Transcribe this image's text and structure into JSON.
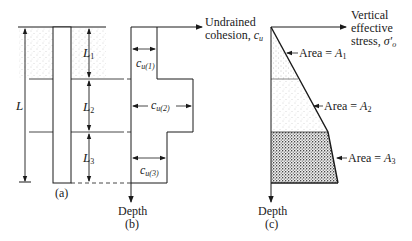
{
  "figure_a": {
    "caption": "(a)",
    "total_length_label": "L",
    "layer_labels": [
      "L",
      "L",
      "L"
    ],
    "layer_subscripts": [
      "1",
      "2",
      "3"
    ]
  },
  "figure_b": {
    "caption": "(b)",
    "x_axis_label_line1": "Undrained",
    "x_axis_label_line2": "cohesion, ",
    "x_axis_symbol": "c",
    "x_axis_symbol_sub": "u",
    "y_axis_label": "Depth",
    "cohesion_labels": [
      {
        "symbol": "c",
        "sub": "u(1)"
      },
      {
        "symbol": "c",
        "sub": "u(2)"
      },
      {
        "symbol": "c",
        "sub": "u(3)"
      }
    ]
  },
  "figure_c": {
    "caption": "(c)",
    "x_axis_label_line1": "Vertical",
    "x_axis_label_line2": "effective",
    "x_axis_label_line3": "stress, ",
    "x_axis_symbol": "σ′",
    "x_axis_symbol_sub": "o",
    "y_axis_label": "Depth",
    "area_labels": [
      {
        "text": "Area = ",
        "symbol": "A",
        "sub": "1"
      },
      {
        "text": "Area = ",
        "symbol": "A",
        "sub": "2"
      },
      {
        "text": "Area = ",
        "symbol": "A",
        "sub": "3"
      }
    ]
  },
  "colors": {
    "line": "#1a1a1a",
    "stipple_light": "#9a9a9a",
    "stipple_dense": "#222222",
    "background": "#ffffff"
  }
}
